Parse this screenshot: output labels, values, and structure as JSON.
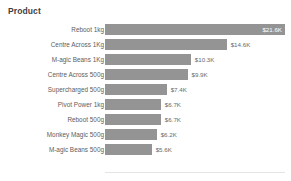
{
  "chart_data": {
    "type": "bar",
    "orientation": "horizontal",
    "title": "Product",
    "xlabel": "",
    "ylabel": "",
    "grid": false,
    "legend": false,
    "axis_tick_labels": [],
    "xlim": [
      0,
      21.6
    ],
    "categories": [
      "Reboot 1kg",
      "Centre Across 1Kg",
      "M-agic Beans 1Kg",
      "Centre Across 500g",
      "Supercharged 500g",
      "Pivot Power 1kg",
      "Reboot 500g",
      "Monkey Magic 500g",
      "M-agic Beans 500g"
    ],
    "values": [
      21.6,
      14.6,
      10.3,
      9.9,
      7.4,
      6.7,
      6.7,
      6.2,
      5.6
    ],
    "value_labels": [
      "$21.6K",
      "$14.6K",
      "$10.3K",
      "$9.9K",
      "$7.4K",
      "$6.7K",
      "$6.7K",
      "$6.2K",
      "$5.6K"
    ],
    "label_placement": [
      "inside",
      "outside",
      "outside",
      "outside",
      "outside",
      "outside",
      "outside",
      "outside",
      "outside"
    ],
    "colors": {
      "bar": "#949494",
      "title_text": "#3f3f3f",
      "category_text": "#5d5d5d",
      "value_text_outside": "#6a6a6a",
      "value_text_inside": "#ffffff",
      "background": "#ffffff",
      "axis_line": "#e4e4e4"
    }
  }
}
